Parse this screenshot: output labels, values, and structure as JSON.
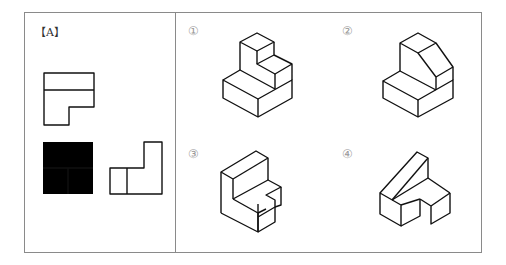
{
  "problem": {
    "given_label": "【A】",
    "given_views": [
      "top-view",
      "front-view",
      "side-view"
    ],
    "options": [
      {
        "number": "①",
        "label": "option-1"
      },
      {
        "number": "②",
        "label": "option-2"
      },
      {
        "number": "③",
        "label": "option-3"
      },
      {
        "number": "④",
        "label": "option-4"
      }
    ]
  },
  "colors": {
    "line": "#111111",
    "frame": "#8a8a8a",
    "number": "#999999"
  }
}
